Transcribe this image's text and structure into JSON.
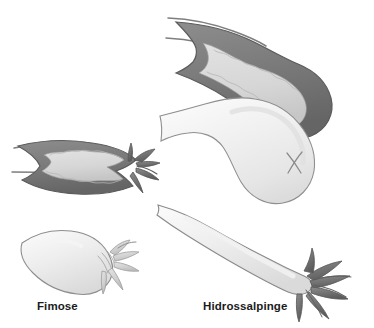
{
  "figure": {
    "background_color": "#ffffff",
    "width": 374,
    "height": 328,
    "labels": [
      {
        "id": "fimose",
        "text": "Fimose",
        "x": 37,
        "y": 300
      },
      {
        "id": "hidrossalpinge",
        "text": "Hidrossalpinge",
        "x": 203,
        "y": 300
      }
    ],
    "palette": {
      "wall_dark": "#7a7a7a",
      "wall_dark_edge": "#5e5e5e",
      "lumen_light": "#d9d9d9",
      "sac_pale": "#efefef",
      "sac_pale_edge": "#8a8a8a",
      "outline": "#6b6b6b",
      "fimbriae_dark": "#6f6f6f",
      "fimbriae_light": "#c9c9c9",
      "text": "#1b1b1b"
    },
    "panels": [
      {
        "id": "top-right-occluded-tube",
        "name": "occluded-thick-walled-tube",
        "column": "right",
        "row": "top",
        "description": "Tubo de parede espessa escura com extremidade distal bulbosa e lume claro ondulado",
        "fill": "wall_dark",
        "lumen_fill": "lumen_light",
        "has_fimbriae": false,
        "has_x_mark": false
      },
      {
        "id": "middle-left-spindle-tube",
        "name": "spindle-shaped-tube-with-lumen",
        "column": "left",
        "row": "middle",
        "description": "Tuba fusiforme de parede escura com lume claro recortado e fimbrias escuras aglomeradas",
        "fill": "wall_dark",
        "lumen_fill": "lumen_light",
        "has_fimbriae": true,
        "fimbriae_tone": "dark",
        "has_x_mark": false
      },
      {
        "id": "middle-right-distended-sac",
        "name": "distended-pale-sac",
        "column": "right",
        "row": "middle",
        "description": "Saco distendido palido de contorno fino com marca em X na regiao inferior direita",
        "fill": "sac_pale",
        "lumen_fill": "sac_pale",
        "has_fimbriae": false,
        "has_x_mark": true,
        "x_mark": {
          "x": 296,
          "y": 163
        }
      },
      {
        "id": "bottom-left-pale-teardrop",
        "name": "pale-teardrop-tube",
        "column": "left",
        "row": "bottom",
        "description": "Tuba palida em forma de gota com pequenas fimbrias claras a direita",
        "fill": "sac_pale",
        "lumen_fill": "sac_pale",
        "has_fimbriae": true,
        "fimbriae_tone": "light",
        "has_x_mark": false,
        "label_ref": "fimose"
      },
      {
        "id": "bottom-right-hydrosalpinx",
        "name": "hydrosalpinx-dilated-tube",
        "column": "right",
        "row": "bottom",
        "description": "Tuba dilatada palida alongada com fimbrias escuras espiculadas na extremidade distal",
        "fill": "sac_pale",
        "lumen_fill": "sac_pale",
        "has_fimbriae": true,
        "fimbriae_tone": "dark",
        "has_x_mark": false,
        "label_ref": "hidrossalpinge"
      }
    ]
  }
}
